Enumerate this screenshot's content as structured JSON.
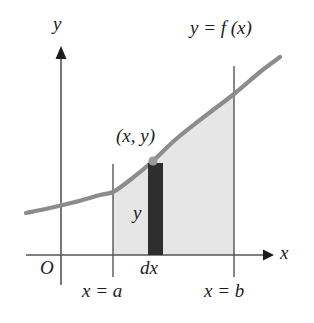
{
  "figure": {
    "background_color": "#ffffff"
  },
  "labels": {
    "curve_label": "y = f (x)",
    "y_axis": "y",
    "x_axis": "x",
    "origin": "O",
    "point": "(x, y)",
    "strip_height": "y",
    "strip_width": "dx",
    "left_bound": "x = a",
    "right_bound": "x = b"
  },
  "colors": {
    "curve": "#8c8c8c",
    "axis": "#555555",
    "shaded_region": "#e6e6e6",
    "strip": "#2e2e2e",
    "point_marker": "#9a9a9a",
    "text": "#1c1c1c",
    "bound_line": "#555555"
  },
  "chart_data": {
    "type": "area",
    "xlabel": "x",
    "ylabel": "y",
    "grid": false,
    "legend": "none",
    "axes": {
      "origin_px": [
        61,
        255
      ],
      "x_axis_y_px": 255,
      "y_axis_x_px": 61,
      "x_axis_start_px": 26,
      "x_axis_arrow_tip_px": 272,
      "y_axis_bottom_px": 285,
      "y_axis_arrow_tip_px": 47
    },
    "curve": {
      "name": "y = f (x)",
      "description": "increasing convex curve",
      "points_px": [
        [
          26,
          213
        ],
        [
          50,
          208
        ],
        [
          75,
          202
        ],
        [
          100,
          195
        ],
        [
          113,
          192
        ],
        [
          130,
          180
        ],
        [
          153,
          161
        ],
        [
          175,
          140
        ],
        [
          200,
          120
        ],
        [
          234,
          94
        ],
        [
          260,
          72
        ],
        [
          280,
          57
        ]
      ]
    },
    "shaded_region": {
      "label": "area under curve",
      "x_from_px": 113,
      "x_to_px": 234,
      "bounded_below_px": 255,
      "fill": "#e6e6e6"
    },
    "strip": {
      "label": "dx",
      "x_left_px": 148,
      "x_right_px": 163,
      "y_top_px": 163,
      "y_bottom_px": 255,
      "fill": "#2e2e2e"
    },
    "point_marker": {
      "label": "(x, y)",
      "x_px": 153,
      "y_px": 161
    },
    "vertical_lines": [
      {
        "label": "x = a",
        "x_px": 113,
        "y_top_px": 164,
        "y_bottom_px": 277
      },
      {
        "label": "x = b",
        "x_px": 234,
        "y_top_px": 66,
        "y_bottom_px": 277
      }
    ]
  }
}
